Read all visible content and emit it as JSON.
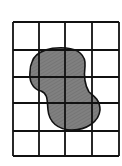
{
  "diagram": {
    "type": "grid-area-estimation",
    "grid": {
      "columns": 4,
      "rows": 5,
      "x_lines": [
        13,
        39,
        65,
        92,
        119
      ],
      "y_lines": [
        22,
        50,
        77,
        103,
        131,
        156
      ],
      "line_color": "#111111"
    },
    "shape": {
      "name": "irregular-blob",
      "fill_color": "#7a7a7a",
      "stroke_color": "#111111"
    }
  }
}
